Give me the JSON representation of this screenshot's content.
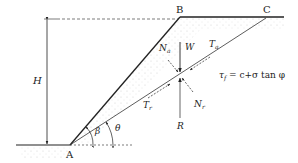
{
  "diagram": {
    "type": "slope-stability-wedge",
    "points": {
      "A": "A",
      "B": "B",
      "C": "C"
    },
    "labels": {
      "height": "H",
      "weight": "W",
      "normal_active": "N",
      "normal_active_sub": "a",
      "shear_active": "T",
      "shear_active_sub": "a",
      "shear_resisting": "T",
      "shear_resisting_sub": "r",
      "normal_resisting": "N",
      "normal_resisting_sub": "r",
      "resultant": "R",
      "slope_angle": "β",
      "plane_angle": "θ"
    },
    "equation": {
      "lhs": "τ",
      "lhs_sub": "f",
      "rhs": " = c+σ tan φ"
    },
    "colors": {
      "line": "#222222",
      "soil_dots": "#c8c8c8",
      "arrow_R": "#555555"
    }
  }
}
